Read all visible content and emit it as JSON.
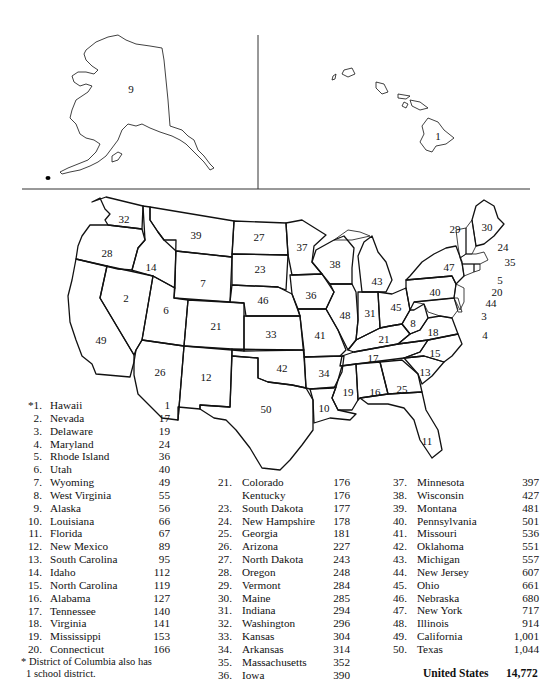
{
  "map": {
    "title_implied": "Number of school districts by state",
    "insets": {
      "alaska": {
        "rank": "9"
      },
      "hawaii": {
        "rank": "1"
      }
    },
    "state_labels": [
      {
        "rank": "32",
        "x": 124,
        "y": 219
      },
      {
        "rank": "28",
        "x": 107,
        "y": 253
      },
      {
        "rank": "39",
        "x": 196,
        "y": 235
      },
      {
        "rank": "27",
        "x": 259,
        "y": 237
      },
      {
        "rank": "37",
        "x": 302,
        "y": 247
      },
      {
        "rank": "14",
        "x": 151,
        "y": 267
      },
      {
        "rank": "23",
        "x": 260,
        "y": 269
      },
      {
        "rank": "7",
        "x": 203,
        "y": 283
      },
      {
        "rank": "2",
        "x": 126,
        "y": 298
      },
      {
        "rank": "6",
        "x": 166,
        "y": 310
      },
      {
        "rank": "46",
        "x": 263,
        "y": 300
      },
      {
        "rank": "21",
        "x": 216,
        "y": 326
      },
      {
        "rank": "33",
        "x": 271,
        "y": 334
      },
      {
        "rank": "49",
        "x": 101,
        "y": 340
      },
      {
        "rank": "26",
        "x": 160,
        "y": 372
      },
      {
        "rank": "12",
        "x": 206,
        "y": 377
      },
      {
        "rank": "42",
        "x": 282,
        "y": 368
      },
      {
        "rank": "50",
        "x": 266,
        "y": 409
      },
      {
        "rank": "38",
        "x": 335,
        "y": 264
      },
      {
        "rank": "43",
        "x": 377,
        "y": 281
      },
      {
        "rank": "36",
        "x": 311,
        "y": 295
      },
      {
        "rank": "48",
        "x": 345,
        "y": 315
      },
      {
        "rank": "31",
        "x": 370,
        "y": 313
      },
      {
        "rank": "45",
        "x": 396,
        "y": 307
      },
      {
        "rank": "41",
        "x": 320,
        "y": 335
      },
      {
        "rank": "34",
        "x": 324,
        "y": 373
      },
      {
        "rank": "21b",
        "label": "21",
        "x": 384,
        "y": 339
      },
      {
        "rank": "8",
        "x": 413,
        "y": 323
      },
      {
        "rank": "18",
        "x": 433,
        "y": 332
      },
      {
        "rank": "17",
        "x": 373,
        "y": 358
      },
      {
        "rank": "15",
        "x": 435,
        "y": 353
      },
      {
        "rank": "13",
        "x": 425,
        "y": 372
      },
      {
        "rank": "19",
        "x": 348,
        "y": 392
      },
      {
        "rank": "16",
        "x": 375,
        "y": 392
      },
      {
        "rank": "25",
        "x": 402,
        "y": 389
      },
      {
        "rank": "10",
        "x": 324,
        "y": 408
      },
      {
        "rank": "11",
        "x": 427,
        "y": 441
      },
      {
        "rank": "47",
        "x": 449,
        "y": 267
      },
      {
        "rank": "40",
        "x": 435,
        "y": 292
      },
      {
        "rank": "29",
        "x": 455,
        "y": 229
      },
      {
        "rank": "30",
        "x": 487,
        "y": 227
      },
      {
        "rank": "24",
        "x": 503,
        "y": 247
      },
      {
        "rank": "35",
        "x": 510,
        "y": 262
      },
      {
        "rank": "5",
        "x": 500,
        "y": 280
      },
      {
        "rank": "20",
        "x": 497,
        "y": 292
      },
      {
        "rank": "44",
        "x": 491,
        "y": 303
      },
      {
        "rank": "3",
        "x": 484,
        "y": 316
      },
      {
        "rank": "4",
        "x": 485,
        "y": 335
      }
    ]
  },
  "legend": {
    "columns": [
      [
        {
          "num": "*1.",
          "name": "Hawaii",
          "value": "1"
        },
        {
          "num": "2.",
          "name": "Nevada",
          "value": "17"
        },
        {
          "num": "3.",
          "name": "Delaware",
          "value": "19"
        },
        {
          "num": "4.",
          "name": "Maryland",
          "value": "24"
        },
        {
          "num": "5.",
          "name": "Rhode Island",
          "value": "36"
        },
        {
          "num": "6.",
          "name": "Utah",
          "value": "40"
        },
        {
          "num": "7.",
          "name": "Wyoming",
          "value": "49"
        },
        {
          "num": "8.",
          "name": "West Virginia",
          "value": "55"
        },
        {
          "num": "9.",
          "name": "Alaska",
          "value": "56"
        },
        {
          "num": "10.",
          "name": "Louisiana",
          "value": "66"
        },
        {
          "num": "11.",
          "name": "Florida",
          "value": "67"
        },
        {
          "num": "12.",
          "name": "New Mexico",
          "value": "89"
        },
        {
          "num": "13.",
          "name": "South Carolina",
          "value": "95"
        },
        {
          "num": "14.",
          "name": "Idaho",
          "value": "112"
        },
        {
          "num": "15.",
          "name": "North Carolina",
          "value": "119"
        },
        {
          "num": "16.",
          "name": "Alabama",
          "value": "127"
        },
        {
          "num": "17.",
          "name": "Tennessee",
          "value": "140"
        },
        {
          "num": "18.",
          "name": "Virginia",
          "value": "141"
        },
        {
          "num": "19.",
          "name": "Mississippi",
          "value": "153"
        },
        {
          "num": "20.",
          "name": "Connecticut",
          "value": "166"
        }
      ],
      [
        {
          "num": "21.",
          "name": "Colorado",
          "value": "176"
        },
        {
          "num": "",
          "name": "Kentucky",
          "value": "176"
        },
        {
          "num": "23.",
          "name": "South Dakota",
          "value": "177"
        },
        {
          "num": "24.",
          "name": "New Hampshire",
          "value": "178"
        },
        {
          "num": "25.",
          "name": "Georgia",
          "value": "181"
        },
        {
          "num": "26.",
          "name": "Arizona",
          "value": "227"
        },
        {
          "num": "27.",
          "name": "North Dakota",
          "value": "243"
        },
        {
          "num": "28.",
          "name": "Oregon",
          "value": "248"
        },
        {
          "num": "29.",
          "name": "Vermont",
          "value": "284"
        },
        {
          "num": "30.",
          "name": "Maine",
          "value": "285"
        },
        {
          "num": "31.",
          "name": "Indiana",
          "value": "294"
        },
        {
          "num": "32.",
          "name": "Washington",
          "value": "296"
        },
        {
          "num": "33.",
          "name": "Kansas",
          "value": "304"
        },
        {
          "num": "34.",
          "name": "Arkansas",
          "value": "314"
        },
        {
          "num": "35.",
          "name": "Massachusetts",
          "value": "352"
        },
        {
          "num": "36.",
          "name": "Iowa",
          "value": "390"
        }
      ],
      [
        {
          "num": "37.",
          "name": "Minnesota",
          "value": "397"
        },
        {
          "num": "38.",
          "name": "Wisconsin",
          "value": "427"
        },
        {
          "num": "39.",
          "name": "Montana",
          "value": "481"
        },
        {
          "num": "40.",
          "name": "Pennsylvania",
          "value": "501"
        },
        {
          "num": "41.",
          "name": "Missouri",
          "value": "536"
        },
        {
          "num": "42.",
          "name": "Oklahoma",
          "value": "551"
        },
        {
          "num": "43.",
          "name": "Michigan",
          "value": "557"
        },
        {
          "num": "44.",
          "name": "New Jersey",
          "value": "607"
        },
        {
          "num": "45.",
          "name": "Ohio",
          "value": "661"
        },
        {
          "num": "46.",
          "name": "Nebraska",
          "value": "680"
        },
        {
          "num": "47.",
          "name": "New York",
          "value": "717"
        },
        {
          "num": "48.",
          "name": "Illinois",
          "value": "914"
        },
        {
          "num": "49.",
          "name": "California",
          "value": "1,001"
        },
        {
          "num": "50.",
          "name": "Texas",
          "value": "1,044"
        }
      ]
    ],
    "footnote_line1": "* District of Columbia also has",
    "footnote_line2": "1 school district.",
    "total_label": "United States",
    "total_value": "14,772"
  }
}
